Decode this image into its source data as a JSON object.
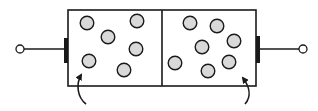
{
  "diagram": {
    "title": "Two-chamber container with gas particles and electrode terminals",
    "colors": {
      "stroke": "#1a1a1a",
      "particle_fill": "#d9d9d9",
      "background": "#ffffff"
    },
    "container": {
      "x": 68,
      "y": 10,
      "width": 188,
      "height": 76,
      "divider_x": 162
    },
    "chambers": [
      {
        "name": "left-chamber",
        "particle_count": 6,
        "particles": [
          {
            "cx": 87,
            "cy": 23
          },
          {
            "cx": 137,
            "cy": 21
          },
          {
            "cx": 108,
            "cy": 37
          },
          {
            "cx": 136,
            "cy": 49
          },
          {
            "cx": 89,
            "cy": 61
          },
          {
            "cx": 124,
            "cy": 70
          }
        ]
      },
      {
        "name": "right-chamber",
        "particle_count": 7,
        "particles": [
          {
            "cx": 190,
            "cy": 23
          },
          {
            "cx": 217,
            "cy": 26
          },
          {
            "cx": 202,
            "cy": 47
          },
          {
            "cx": 234,
            "cy": 41
          },
          {
            "cx": 175,
            "cy": 63
          },
          {
            "cx": 208,
            "cy": 71
          },
          {
            "cx": 229,
            "cy": 62
          }
        ]
      }
    ],
    "terminals": [
      {
        "name": "left-terminal",
        "circle_cx": 20,
        "circle_cy": 49,
        "plate_x": 66,
        "plate_y1": 38,
        "plate_y2": 62
      },
      {
        "name": "right-terminal",
        "circle_cx": 303,
        "circle_cy": 49,
        "plate_x": 258,
        "plate_y1": 36,
        "plate_y2": 62
      }
    ],
    "arrows": [
      {
        "name": "left-arrow",
        "from": [
          86,
          104
        ],
        "to": [
          82,
          73
        ]
      },
      {
        "name": "right-arrow",
        "from": [
          245,
          104
        ],
        "to": [
          241,
          76
        ]
      }
    ]
  }
}
